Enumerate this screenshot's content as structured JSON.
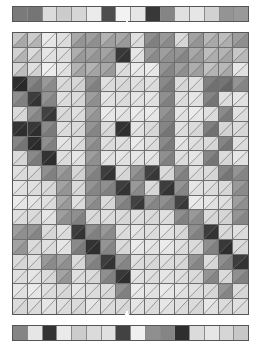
{
  "figure": {
    "title": "",
    "caption": "",
    "background": "#ffffff",
    "border_color": "#555555",
    "grid_line_color": "#6f6f6f",
    "pointer_color": "#ffffff"
  },
  "layout": {
    "width": 261,
    "height": 359,
    "top_bar": {
      "x": 12,
      "y": 6,
      "width": 237,
      "height": 16
    },
    "matrix": {
      "x": 12,
      "y": 32,
      "width": 237,
      "height": 283,
      "cols": 16,
      "rows": 19
    },
    "bottom_bar": {
      "x": 12,
      "y": 325,
      "width": 237,
      "height": 16
    },
    "top_pointer": {
      "x": 123,
      "y": 21,
      "width": 8,
      "height": 12,
      "direction": "down"
    },
    "bottom_pointer": {
      "x": 123,
      "y": 311,
      "width": 8,
      "height": 16,
      "direction": "up"
    }
  },
  "chart_data": {
    "type": "heatmap",
    "title": "",
    "xlabel": "",
    "ylabel": "",
    "grid": true,
    "legend": null,
    "colormap": "grayscale",
    "value_range": [
      0,
      1
    ],
    "cols": 16,
    "rows": 19,
    "top_marginal": {
      "name": "top marginal bar",
      "values": [
        0.48,
        0.46,
        0.86,
        0.8,
        0.84,
        0.92,
        0.3,
        0.95,
        0.9,
        0.22,
        0.52,
        0.88,
        0.9,
        0.82,
        0.58,
        0.6
      ]
    },
    "bottom_marginal": {
      "name": "bottom marginal bar",
      "values": [
        0.52,
        0.9,
        0.2,
        0.92,
        0.8,
        0.86,
        0.88,
        0.26,
        0.94,
        0.56,
        0.52,
        0.18,
        0.86,
        0.9,
        0.84,
        0.78
      ]
    },
    "cells_upper": [
      [
        0.78,
        0.8,
        0.92,
        0.88,
        0.66,
        0.62,
        0.7,
        0.66,
        0.88,
        0.56,
        0.6,
        0.86,
        0.64,
        0.72,
        0.74,
        0.62
      ],
      [
        0.82,
        0.86,
        0.9,
        0.88,
        0.68,
        0.64,
        0.64,
        0.22,
        0.9,
        0.6,
        0.62,
        0.58,
        0.66,
        0.74,
        0.7,
        0.78
      ],
      [
        0.84,
        0.88,
        0.94,
        0.9,
        0.7,
        0.7,
        0.66,
        0.88,
        0.92,
        0.92,
        0.58,
        0.62,
        0.68,
        0.76,
        0.72,
        0.9
      ],
      [
        0.18,
        0.52,
        0.6,
        0.86,
        0.84,
        0.56,
        0.88,
        0.86,
        0.88,
        0.88,
        0.54,
        0.86,
        0.88,
        0.5,
        0.46,
        0.58
      ],
      [
        0.56,
        0.24,
        0.58,
        0.88,
        0.86,
        0.62,
        0.9,
        0.88,
        0.9,
        0.9,
        0.56,
        0.88,
        0.9,
        0.52,
        0.88,
        0.9
      ],
      [
        0.86,
        0.58,
        0.26,
        0.86,
        0.88,
        0.64,
        0.92,
        0.9,
        0.92,
        0.92,
        0.58,
        0.9,
        0.92,
        0.88,
        0.54,
        0.88
      ],
      [
        0.2,
        0.22,
        0.54,
        0.88,
        0.86,
        0.58,
        0.86,
        0.2,
        0.9,
        0.86,
        0.52,
        0.88,
        0.86,
        0.5,
        0.84,
        0.86
      ],
      [
        0.52,
        0.18,
        0.56,
        0.9,
        0.88,
        0.6,
        0.88,
        0.88,
        0.92,
        0.88,
        0.54,
        0.9,
        0.88,
        0.86,
        0.52,
        0.88
      ],
      [
        0.86,
        0.54,
        0.2,
        0.88,
        0.9,
        0.62,
        0.9,
        0.9,
        0.9,
        0.9,
        0.56,
        0.88,
        0.9,
        0.52,
        0.86,
        0.9
      ],
      [
        0.88,
        0.86,
        0.56,
        0.62,
        0.84,
        0.56,
        0.24,
        0.86,
        0.58,
        0.26,
        0.86,
        0.56,
        0.88,
        0.86,
        0.52,
        0.58
      ],
      [
        0.9,
        0.88,
        0.86,
        0.64,
        0.86,
        0.58,
        0.56,
        0.24,
        0.6,
        0.86,
        0.24,
        0.58,
        0.9,
        0.88,
        0.86,
        0.6
      ],
      [
        0.92,
        0.9,
        0.88,
        0.66,
        0.88,
        0.6,
        0.86,
        0.56,
        0.26,
        0.58,
        0.56,
        0.26,
        0.92,
        0.9,
        0.88,
        0.62
      ],
      [
        0.88,
        0.86,
        0.9,
        0.62,
        0.56,
        0.86,
        0.88,
        0.86,
        0.88,
        0.86,
        0.88,
        0.56,
        0.6,
        0.86,
        0.84,
        0.58
      ],
      [
        0.62,
        0.58,
        0.86,
        0.88,
        0.24,
        0.56,
        0.6,
        0.88,
        0.9,
        0.88,
        0.9,
        0.86,
        0.56,
        0.24,
        0.86,
        0.88
      ],
      [
        0.64,
        0.86,
        0.88,
        0.9,
        0.54,
        0.2,
        0.58,
        0.86,
        0.92,
        0.9,
        0.92,
        0.88,
        0.86,
        0.56,
        0.22,
        0.86
      ],
      [
        0.86,
        0.88,
        0.6,
        0.62,
        0.86,
        0.56,
        0.24,
        0.58,
        0.88,
        0.86,
        0.88,
        0.86,
        0.58,
        0.86,
        0.56,
        0.24
      ],
      [
        0.88,
        0.9,
        0.86,
        0.64,
        0.88,
        0.86,
        0.56,
        0.22,
        0.9,
        0.88,
        0.9,
        0.88,
        0.86,
        0.58,
        0.86,
        0.56
      ],
      [
        0.9,
        0.92,
        0.88,
        0.86,
        0.9,
        0.88,
        0.86,
        0.56,
        0.92,
        0.9,
        0.92,
        0.9,
        0.88,
        0.86,
        0.58,
        0.86
      ],
      [
        0.86,
        0.88,
        0.9,
        0.88,
        0.86,
        0.9,
        0.88,
        0.86,
        0.9,
        0.88,
        0.9,
        0.88,
        0.86,
        0.9,
        0.86,
        0.88
      ]
    ],
    "cells_lower": [
      [
        0.66,
        0.7,
        0.9,
        0.86,
        0.58,
        0.56,
        0.62,
        0.6,
        0.86,
        0.5,
        0.54,
        0.84,
        0.58,
        0.66,
        0.68,
        0.56
      ],
      [
        0.7,
        0.78,
        0.88,
        0.86,
        0.6,
        0.58,
        0.58,
        0.2,
        0.88,
        0.54,
        0.56,
        0.52,
        0.6,
        0.68,
        0.64,
        0.72
      ],
      [
        0.74,
        0.82,
        0.92,
        0.88,
        0.64,
        0.64,
        0.6,
        0.86,
        0.9,
        0.9,
        0.52,
        0.56,
        0.62,
        0.7,
        0.66,
        0.88
      ],
      [
        0.16,
        0.46,
        0.54,
        0.84,
        0.82,
        0.5,
        0.86,
        0.84,
        0.86,
        0.86,
        0.48,
        0.84,
        0.86,
        0.44,
        0.4,
        0.52
      ],
      [
        0.5,
        0.2,
        0.52,
        0.86,
        0.84,
        0.56,
        0.88,
        0.86,
        0.88,
        0.88,
        0.5,
        0.86,
        0.88,
        0.46,
        0.86,
        0.88
      ],
      [
        0.84,
        0.52,
        0.22,
        0.84,
        0.86,
        0.58,
        0.9,
        0.88,
        0.9,
        0.9,
        0.52,
        0.88,
        0.9,
        0.86,
        0.48,
        0.86
      ],
      [
        0.18,
        0.18,
        0.48,
        0.86,
        0.84,
        0.52,
        0.84,
        0.18,
        0.88,
        0.84,
        0.46,
        0.86,
        0.84,
        0.44,
        0.82,
        0.84
      ],
      [
        0.46,
        0.16,
        0.5,
        0.88,
        0.86,
        0.54,
        0.86,
        0.86,
        0.9,
        0.86,
        0.48,
        0.88,
        0.86,
        0.84,
        0.46,
        0.86
      ],
      [
        0.84,
        0.48,
        0.18,
        0.86,
        0.88,
        0.56,
        0.88,
        0.88,
        0.88,
        0.88,
        0.5,
        0.86,
        0.88,
        0.46,
        0.84,
        0.88
      ],
      [
        0.86,
        0.84,
        0.5,
        0.56,
        0.82,
        0.5,
        0.2,
        0.84,
        0.52,
        0.22,
        0.84,
        0.5,
        0.86,
        0.84,
        0.46,
        0.52
      ],
      [
        0.88,
        0.86,
        0.84,
        0.58,
        0.84,
        0.52,
        0.5,
        0.2,
        0.54,
        0.84,
        0.2,
        0.52,
        0.88,
        0.86,
        0.84,
        0.54
      ],
      [
        0.9,
        0.88,
        0.86,
        0.6,
        0.86,
        0.54,
        0.84,
        0.5,
        0.22,
        0.52,
        0.5,
        0.22,
        0.9,
        0.88,
        0.86,
        0.56
      ],
      [
        0.86,
        0.84,
        0.88,
        0.56,
        0.5,
        0.84,
        0.86,
        0.84,
        0.86,
        0.84,
        0.86,
        0.5,
        0.54,
        0.84,
        0.82,
        0.52
      ],
      [
        0.56,
        0.52,
        0.84,
        0.86,
        0.2,
        0.5,
        0.54,
        0.86,
        0.88,
        0.86,
        0.88,
        0.84,
        0.5,
        0.2,
        0.84,
        0.86
      ],
      [
        0.58,
        0.84,
        0.86,
        0.88,
        0.48,
        0.18,
        0.52,
        0.84,
        0.9,
        0.88,
        0.9,
        0.86,
        0.84,
        0.5,
        0.18,
        0.84
      ],
      [
        0.84,
        0.86,
        0.54,
        0.56,
        0.84,
        0.5,
        0.2,
        0.52,
        0.86,
        0.84,
        0.86,
        0.84,
        0.52,
        0.84,
        0.5,
        0.2
      ],
      [
        0.86,
        0.88,
        0.84,
        0.58,
        0.86,
        0.84,
        0.5,
        0.18,
        0.88,
        0.86,
        0.88,
        0.86,
        0.84,
        0.52,
        0.84,
        0.5
      ],
      [
        0.88,
        0.9,
        0.86,
        0.84,
        0.88,
        0.86,
        0.84,
        0.5,
        0.9,
        0.88,
        0.9,
        0.88,
        0.86,
        0.84,
        0.52,
        0.84
      ],
      [
        0.84,
        0.86,
        0.88,
        0.86,
        0.84,
        0.88,
        0.86,
        0.84,
        0.88,
        0.86,
        0.88,
        0.86,
        0.84,
        0.88,
        0.84,
        0.86
      ]
    ]
  },
  "annotations": {
    "top_pointer_label": "",
    "bottom_pointer_label": ""
  }
}
